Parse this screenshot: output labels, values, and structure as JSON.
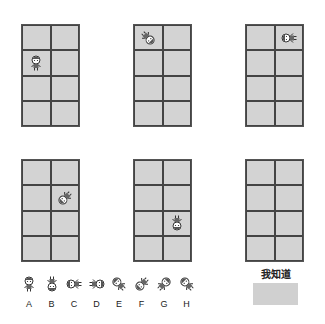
{
  "grids": [
    {
      "id": 1,
      "figure": {
        "row": 1,
        "col": 0,
        "rotation": 0
      }
    },
    {
      "id": 2,
      "figure": {
        "row": 0,
        "col": 0,
        "rotation": 135
      }
    },
    {
      "id": 3,
      "figure": {
        "row": 0,
        "col": 1,
        "rotation": 270
      }
    },
    {
      "id": 4,
      "figure": {
        "row": 1,
        "col": 1,
        "rotation": 225
      }
    },
    {
      "id": 5,
      "figure": {
        "row": 2,
        "col": 1,
        "rotation": 180
      }
    },
    {
      "id": 6,
      "figure": null
    }
  ],
  "options": [
    {
      "label": "A",
      "rotation": 0
    },
    {
      "label": "B",
      "rotation": 180
    },
    {
      "label": "C",
      "rotation": 270
    },
    {
      "label": "D",
      "rotation": 90
    },
    {
      "label": "E",
      "rotation": 315
    },
    {
      "label": "F",
      "rotation": 225
    },
    {
      "label": "G",
      "rotation": 45
    },
    {
      "label": "H",
      "rotation": 315
    }
  ],
  "answer_button": {
    "label": "我知道"
  },
  "colors": {
    "grid_fill": "#d3d3d3",
    "grid_line": "#444444",
    "button_fill": "#d0d0d0"
  }
}
